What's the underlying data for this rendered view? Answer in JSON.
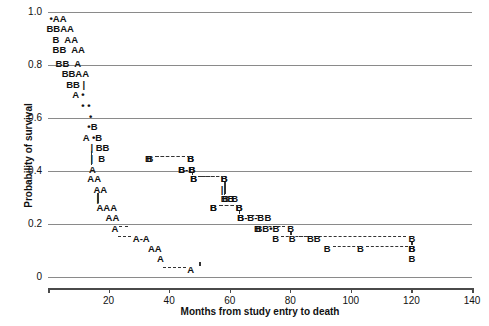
{
  "chart_data": {
    "type": "scatter",
    "title": "",
    "subtitle": "",
    "xlabel": "Months from study entry to death",
    "ylabel": "Probability of survival",
    "xlim": [
      0,
      140
    ],
    "ylim": [
      0,
      1.0
    ],
    "xticks": [
      20,
      40,
      60,
      80,
      100,
      120,
      140
    ],
    "xtick_labels": [
      "20",
      "40",
      "60",
      "80",
      "100",
      "120",
      "140"
    ],
    "yticks": [
      0,
      0.2,
      0.4,
      0.6,
      0.8,
      1.0
    ],
    "ytick_labels": [
      "0",
      "0.2",
      "0.4",
      "0.6",
      "0.8",
      "1.0"
    ],
    "grid": true,
    "grid_axis": "y",
    "legend": "none",
    "marker_labels": [
      "A",
      "B",
      "•"
    ],
    "rows": [
      {
        "y": 0.975,
        "text": "•AA",
        "x": 0.5
      },
      {
        "y": 0.935,
        "text": "BBAA",
        "x": -0.5
      },
      {
        "y": 0.895,
        "text": "B  AA",
        "x": 1.5
      },
      {
        "y": 0.855,
        "text": "BB  AA",
        "x": 1.5
      },
      {
        "y": 0.805,
        "text": "BB  A",
        "x": 2.5
      },
      {
        "y": 0.765,
        "text": "BBAA",
        "x": 4.5
      },
      {
        "y": 0.725,
        "text": "BB |",
        "x": 6.0
      },
      {
        "y": 0.685,
        "text": "A •",
        "x": 8.0
      },
      {
        "y": 0.645,
        "text": "• •",
        "x": 11.0
      },
      {
        "y": 0.605,
        "text": "•",
        "x": 13.5
      },
      {
        "y": 0.565,
        "text": "•B",
        "x": 13.0
      },
      {
        "y": 0.525,
        "text": "A •B",
        "x": 11.5
      },
      {
        "y": 0.487,
        "text": "| BB",
        "x": 14.0
      },
      {
        "y": 0.447,
        "text": "|  B",
        "x": 14.0
      },
      {
        "y": 0.405,
        "text": "A",
        "x": 13.5
      },
      {
        "y": 0.368,
        "text": "AA",
        "x": 13.0
      },
      {
        "y": 0.33,
        "text": "AA",
        "x": 15.0
      },
      {
        "y": 0.293,
        "text": "|",
        "x": 16.0
      },
      {
        "y": 0.262,
        "text": "AAA",
        "x": 16.0
      },
      {
        "y": 0.222,
        "text": "AA",
        "x": 19.0
      },
      {
        "y": 0.182,
        "text": "A",
        "x": 21.0
      },
      {
        "y": 0.142,
        "text": "A-A",
        "x": 28.0
      },
      {
        "y": 0.105,
        "text": "AA",
        "x": 33.0
      },
      {
        "y": 0.068,
        "text": "A",
        "x": 36.0
      },
      {
        "y": 0.028,
        "text": "A",
        "x": 46.0
      }
    ],
    "b_curve_points": [
      {
        "x": 33.0,
        "y": 0.447
      },
      {
        "x": 47.0,
        "y": 0.447
      },
      {
        "x": 44.0,
        "y": 0.405
      },
      {
        "x": 47.5,
        "y": 0.405
      },
      {
        "x": 48.0,
        "y": 0.368
      },
      {
        "x": 58.0,
        "y": 0.368
      },
      {
        "x": 58.5,
        "y": 0.293
      },
      {
        "x": 61.5,
        "y": 0.293
      },
      {
        "x": 54.5,
        "y": 0.262
      },
      {
        "x": 63.0,
        "y": 0.262
      },
      {
        "x": 63.5,
        "y": 0.222
      },
      {
        "x": 72.5,
        "y": 0.222
      },
      {
        "x": 69.0,
        "y": 0.182
      },
      {
        "x": 80.0,
        "y": 0.182
      },
      {
        "x": 80.5,
        "y": 0.142
      },
      {
        "x": 120.0,
        "y": 0.142
      },
      {
        "x": 120.0,
        "y": 0.105
      }
    ],
    "a_curve_points": [
      {
        "x": 21.0,
        "y": 0.182
      },
      {
        "x": 28.0,
        "y": 0.182
      },
      {
        "x": 33.0,
        "y": 0.142
      },
      {
        "x": 36.0,
        "y": 0.105
      },
      {
        "x": 46.0,
        "y": 0.068
      },
      {
        "x": 50.0,
        "y": 0.028
      }
    ]
  },
  "axes": {
    "x_title": "Months from study entry to death",
    "y_title": "Probability of survival"
  }
}
